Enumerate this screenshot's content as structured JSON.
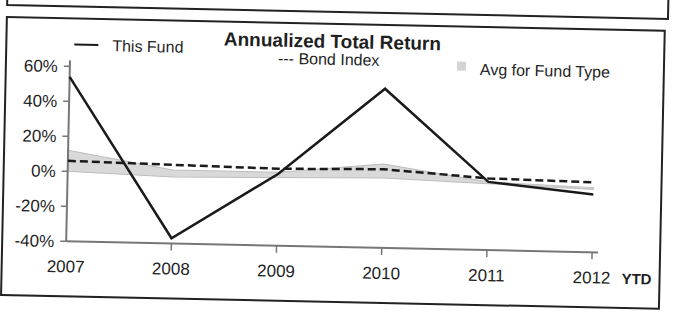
{
  "chart_data": {
    "type": "line",
    "title": "Annualized Total Return",
    "xlabel": "",
    "ylabel": "",
    "categories": [
      "2007",
      "2008",
      "2009",
      "2010",
      "2011",
      "2012"
    ],
    "x_suffix": "YTD",
    "ylim": [
      -40,
      60
    ],
    "yticks": [
      "60%",
      "40%",
      "20%",
      "0%",
      "-20%",
      "-40%"
    ],
    "ytick_values": [
      60,
      40,
      20,
      0,
      -20,
      -40
    ],
    "grid": false,
    "legend_position": "top",
    "series": [
      {
        "name": "This Fund",
        "style": "solid",
        "color": "#1a1a1a",
        "values": [
          54,
          -37,
          1,
          51,
          -1,
          -7
        ]
      },
      {
        "name": "Bond Index",
        "style": "dashed",
        "color": "#1a1a1a",
        "values": [
          6,
          5,
          4,
          5,
          1,
          0
        ]
      },
      {
        "name": "Avg for Fund Type",
        "style": "band",
        "color": "#cccccc",
        "upper": [
          12,
          2,
          2,
          8,
          -1,
          -3
        ],
        "lower": [
          0,
          -2,
          -1,
          0,
          -2,
          -4
        ]
      }
    ]
  },
  "legend": {
    "this_fund": "This Fund",
    "bond_index": "--- Bond Index",
    "avg": "Avg for Fund Type"
  }
}
